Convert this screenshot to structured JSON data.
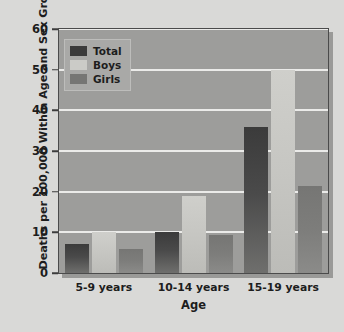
{
  "chart_data": {
    "type": "bar",
    "title": "",
    "xlabel": "Age",
    "ylabel": "Deaths per 100,000 Within Age and Sex Groups",
    "categories": [
      "5-9 years",
      "10-14 years",
      "15-19 years"
    ],
    "series": [
      {
        "name": "Total",
        "color": "#3b3b3b",
        "values": [
          7.2,
          10.0,
          36.0
        ]
      },
      {
        "name": "Boys",
        "color": "#cbcbc7",
        "values": [
          10.0,
          19.0,
          50.0
        ]
      },
      {
        "name": "Girls",
        "color": "#767674",
        "values": [
          6.0,
          9.3,
          21.5
        ]
      }
    ],
    "ylim": [
      0,
      60
    ],
    "yticks": [
      0,
      10,
      20,
      30,
      40,
      50,
      60
    ],
    "ytick_labels": [
      "0",
      "10",
      "20",
      "30",
      "40",
      "50",
      "60"
    ],
    "grid": true,
    "legend_position": "upper-left",
    "legend_entries": [
      "Total",
      "Boys",
      "Girls"
    ]
  }
}
